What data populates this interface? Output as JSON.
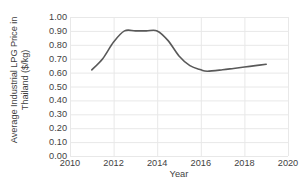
{
  "chart_data": {
    "type": "line",
    "title": "",
    "xlabel": "Year",
    "ylabel": "Average Industrial LPG Price in Thailand ($/kg)",
    "ylabel_lines": [
      "Average Industrial LPG Price in",
      "Thailand ($/kg)"
    ],
    "xlim": [
      2010,
      2020
    ],
    "ylim": [
      0.0,
      1.0
    ],
    "xticks": [
      2010,
      2012,
      2014,
      2016,
      2018,
      2020
    ],
    "xtick_labels": [
      "2010",
      "2012",
      "2014",
      "2016",
      "2018",
      "2020"
    ],
    "yticks": [
      0.0,
      0.1,
      0.2,
      0.3,
      0.4,
      0.5,
      0.6,
      0.7,
      0.8,
      0.9,
      1.0
    ],
    "ytick_labels": [
      "0.00",
      "0.10",
      "0.20",
      "0.30",
      "0.40",
      "0.50",
      "0.60",
      "0.70",
      "0.80",
      "0.90",
      "1.00"
    ],
    "grid": {
      "horizontal": true,
      "vertical": true,
      "color": "#e8e8e8"
    },
    "legend": {
      "visible": false,
      "position": "none"
    },
    "smoothed": true,
    "series": [
      {
        "name": "Average Industrial LPG Price",
        "color": "#595959",
        "line_width": 1.6,
        "x": [
          2011.0,
          2011.5,
          2012.0,
          2012.5,
          2013.0,
          2013.5,
          2014.0,
          2014.5,
          2015.0,
          2015.5,
          2016.0,
          2016.3,
          2017.0,
          2017.5,
          2018.0,
          2018.5,
          2019.0
        ],
        "values": [
          0.62,
          0.7,
          0.82,
          0.9,
          0.9,
          0.9,
          0.9,
          0.83,
          0.72,
          0.65,
          0.62,
          0.61,
          0.62,
          0.63,
          0.64,
          0.65,
          0.66
        ]
      }
    ]
  },
  "colors": {
    "line": "#595959",
    "grid": "#e8e8e8",
    "axis_text": "#3f3f3f",
    "background": "#ffffff"
  },
  "plot_area": {
    "left": 70,
    "right": 288,
    "top": 17,
    "bottom": 156
  }
}
